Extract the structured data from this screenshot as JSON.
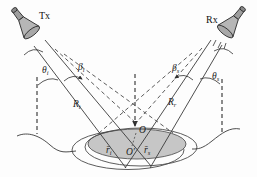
{
  "figure": {
    "transmitter": {
      "label": "Tx"
    },
    "receiver": {
      "label": "Rx"
    },
    "angles": {
      "theta_i": {
        "base": "θ",
        "sub": "i"
      },
      "beta_i": {
        "base": "β",
        "sub": "i"
      },
      "beta_s": {
        "base": "β",
        "sub": "s"
      },
      "theta_s": {
        "base": "θ",
        "sub": "s"
      }
    },
    "ranges": {
      "R_t": {
        "base": "R",
        "sub": "t"
      },
      "R_r": {
        "base": "R",
        "sub": "r"
      }
    },
    "points": {
      "origin": "O",
      "origin_prime": "O′"
    },
    "vectors": {
      "r_i": {
        "base": "r̄",
        "sub": "i"
      },
      "r_s": {
        "base": "r̄",
        "sub": "s"
      }
    },
    "colors": {
      "line": "#3a3a3a",
      "horn_fill": "#b6b6b6",
      "horn_dark": "#9e9e9e",
      "illuminated_area": "#c6c6c6",
      "background": "#fdfdfd"
    }
  }
}
